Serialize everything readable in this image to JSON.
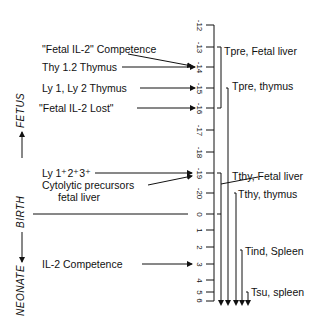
{
  "diagram": {
    "axis": {
      "ticks": [
        {
          "label": "-12",
          "y": 25
        },
        {
          "label": "-13",
          "y": 47
        },
        {
          "label": "-14",
          "y": 67
        },
        {
          "label": "-15",
          "y": 88
        },
        {
          "label": "-16",
          "y": 108
        },
        {
          "label": "-17",
          "y": 130
        },
        {
          "label": "-18",
          "y": 152
        },
        {
          "label": "-19",
          "y": 173
        },
        {
          "label": "-20",
          "y": 193
        },
        {
          "label": "0",
          "y": 214
        },
        {
          "label": "1",
          "y": 230
        },
        {
          "label": "2",
          "y": 247
        },
        {
          "label": "3",
          "y": 264
        },
        {
          "label": "4",
          "y": 280
        },
        {
          "label": "5",
          "y": 292
        },
        {
          "label": "6",
          "y": 300
        }
      ]
    },
    "side_labels": {
      "fetus": "FETUS",
      "birth": "BIRTH",
      "neonate": "NEONATE"
    },
    "events": [
      {
        "text": "\"Fetal IL-2\" Competence",
        "target_tick": "-14"
      },
      {
        "text": "Thy 1.2 Thymus",
        "target_tick": "-14"
      },
      {
        "text": "Ly 1, Ly 2  Thymus",
        "target_tick": "-15"
      },
      {
        "text": "\"Fetal IL-2 Lost\"",
        "target_tick": "-16"
      },
      {
        "text": "Ly 1⁺2⁺3⁺",
        "target_tick": "-19"
      },
      {
        "text": "Cytolytic precursors",
        "target_tick": "-19"
      },
      {
        "text": "fetal liver",
        "target_tick": "-19"
      },
      {
        "text": "IL-2 Competence",
        "target_tick": "3"
      }
    ],
    "stages": [
      {
        "label": "Tpre, Fetal liver"
      },
      {
        "label": "Tpre, thymus"
      },
      {
        "label": "Tthy, Fetal liver"
      },
      {
        "label": "Tthy, thymus"
      },
      {
        "label": "Tind, Spleen"
      },
      {
        "label": "Tsu, spleen"
      }
    ]
  }
}
